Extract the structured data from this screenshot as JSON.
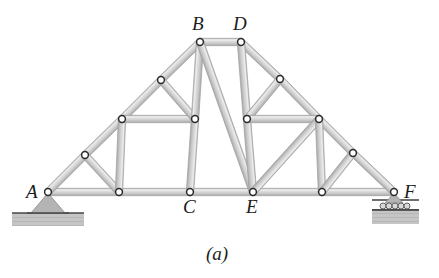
{
  "figure": {
    "caption": "(a)",
    "caption_pos": {
      "x": 206,
      "y": 244
    },
    "background_color": "#ffffff",
    "member_fill_color": "#c9c9c9",
    "member_edge_color": "#a0a0a0",
    "joint_fill_color": "#ffffff",
    "joint_edge_color": "#2b2b2b",
    "ground_color": "#bfbfbf",
    "ground_line_color": "#4a4a4a",
    "support_color": "#b4b4b4",
    "label_color": "#1c1c1c"
  },
  "diagram": {
    "type": "truss-free-body-diagram",
    "span_label_left": "A",
    "span_label_right": "F",
    "nodes": [
      {
        "id": "A",
        "label": "A",
        "x": 48,
        "y": 192,
        "labelled": true,
        "label_pos": {
          "x": 26,
          "y": 182
        }
      },
      {
        "id": "n1",
        "label": "",
        "x": 119,
        "y": 192,
        "labelled": false,
        "label_pos": null
      },
      {
        "id": "C",
        "label": "C",
        "x": 190,
        "y": 192,
        "labelled": true,
        "label_pos": {
          "x": 183,
          "y": 197
        }
      },
      {
        "id": "E",
        "label": "E",
        "x": 253,
        "y": 192,
        "labelled": true,
        "label_pos": {
          "x": 246,
          "y": 197
        }
      },
      {
        "id": "n2",
        "label": "",
        "x": 322,
        "y": 192,
        "labelled": false,
        "label_pos": null
      },
      {
        "id": "F",
        "label": "F",
        "x": 394,
        "y": 192,
        "labelled": true,
        "label_pos": {
          "x": 404,
          "y": 182
        }
      },
      {
        "id": "n3",
        "label": "",
        "x": 85,
        "y": 155,
        "labelled": false,
        "label_pos": null
      },
      {
        "id": "n4",
        "label": "",
        "x": 122,
        "y": 119,
        "labelled": false,
        "label_pos": null
      },
      {
        "id": "n5",
        "label": "",
        "x": 161,
        "y": 80,
        "labelled": false,
        "label_pos": null
      },
      {
        "id": "B",
        "label": "B",
        "x": 200,
        "y": 42,
        "labelled": true,
        "label_pos": {
          "x": 192,
          "y": 14
        }
      },
      {
        "id": "D",
        "label": "D",
        "x": 241,
        "y": 42,
        "labelled": true,
        "label_pos": {
          "x": 233,
          "y": 14
        }
      },
      {
        "id": "n6",
        "label": "",
        "x": 280,
        "y": 79,
        "labelled": false,
        "label_pos": null
      },
      {
        "id": "n7",
        "label": "",
        "x": 319,
        "y": 119,
        "labelled": false,
        "label_pos": null
      },
      {
        "id": "n8",
        "label": "",
        "x": 353,
        "y": 153,
        "labelled": false,
        "label_pos": null
      },
      {
        "id": "n9",
        "label": "",
        "x": 195,
        "y": 119,
        "labelled": false,
        "label_pos": null
      },
      {
        "id": "n10",
        "label": "",
        "x": 247,
        "y": 119,
        "labelled": false,
        "label_pos": null
      }
    ],
    "members": [
      {
        "from": "A",
        "to": "n1"
      },
      {
        "from": "n1",
        "to": "C"
      },
      {
        "from": "C",
        "to": "E"
      },
      {
        "from": "E",
        "to": "n2"
      },
      {
        "from": "n2",
        "to": "F"
      },
      {
        "from": "A",
        "to": "n3"
      },
      {
        "from": "n3",
        "to": "n4"
      },
      {
        "from": "n4",
        "to": "n5"
      },
      {
        "from": "n5",
        "to": "B"
      },
      {
        "from": "B",
        "to": "D"
      },
      {
        "from": "D",
        "to": "n6"
      },
      {
        "from": "n6",
        "to": "n7"
      },
      {
        "from": "n7",
        "to": "n8"
      },
      {
        "from": "n8",
        "to": "F"
      },
      {
        "from": "n3",
        "to": "n1"
      },
      {
        "from": "n4",
        "to": "n1"
      },
      {
        "from": "n4",
        "to": "n9"
      },
      {
        "from": "n5",
        "to": "n9"
      },
      {
        "from": "n9",
        "to": "C"
      },
      {
        "from": "n9",
        "to": "B"
      },
      {
        "from": "B",
        "to": "E"
      },
      {
        "from": "D",
        "to": "n10"
      },
      {
        "from": "n10",
        "to": "E"
      },
      {
        "from": "n10",
        "to": "n6"
      },
      {
        "from": "n10",
        "to": "n7"
      },
      {
        "from": "n7",
        "to": "E"
      },
      {
        "from": "n7",
        "to": "n2"
      },
      {
        "from": "n8",
        "to": "n2"
      }
    ],
    "supports": [
      {
        "type": "pin",
        "at": "A",
        "name": "pin-support",
        "triangle": {
          "apex_x": 48,
          "apex_y": 193,
          "half_width": 17,
          "base_y": 213
        },
        "ground": {
          "x": 12,
          "y": 213,
          "width": 72,
          "height": 13
        }
      },
      {
        "type": "roller",
        "at": "F",
        "name": "roller-support",
        "triangle": {
          "apex_x": 394,
          "apex_y": 193,
          "half_width": 9,
          "base_y": 203
        },
        "rollers": {
          "cx": [
            383,
            389,
            395,
            401,
            407
          ],
          "cy": 206,
          "r": 3
        },
        "plate": {
          "x": 372,
          "y": 199,
          "width": 47,
          "height": 2
        },
        "ground": {
          "x": 372,
          "y": 210,
          "width": 47,
          "height": 14
        }
      }
    ]
  }
}
